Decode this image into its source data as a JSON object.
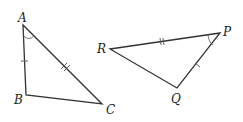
{
  "triangles": [
    {
      "name": "ABC",
      "vertices": {
        "A": {
          "label": "A",
          "x": 23,
          "y": 25
        },
        "B": {
          "label": "B",
          "x": 26,
          "y": 95
        },
        "C": {
          "label": "C",
          "x": 102,
          "y": 104
        }
      },
      "marks": {
        "AB": "single-tick",
        "AC": "double-tick",
        "angle_A": "arc"
      }
    },
    {
      "name": "PQR",
      "vertices": {
        "P": {
          "label": "P",
          "x": 220,
          "y": 33
        },
        "Q": {
          "label": "Q",
          "x": 177,
          "y": 88
        },
        "R": {
          "label": "R",
          "x": 110,
          "y": 49
        }
      },
      "marks": {
        "RP": "double-tick",
        "PQ": "single-tick",
        "angle_P": "arc"
      }
    }
  ],
  "colors": {
    "line": "#333333",
    "text": "#222222",
    "background": "#ffffff"
  }
}
